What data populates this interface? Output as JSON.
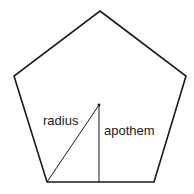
{
  "diagram": {
    "shape": "regular pentagon",
    "labels": {
      "radius": "radius",
      "apothem": "apothem"
    },
    "vertices": [
      [
        100,
        11
      ],
      [
        186,
        76
      ],
      [
        154,
        182
      ],
      [
        47,
        182
      ],
      [
        14,
        76
      ]
    ],
    "center": [
      99,
      105
    ],
    "colors": {
      "stroke": "#1a1a1a",
      "background": "#ffffff"
    }
  }
}
